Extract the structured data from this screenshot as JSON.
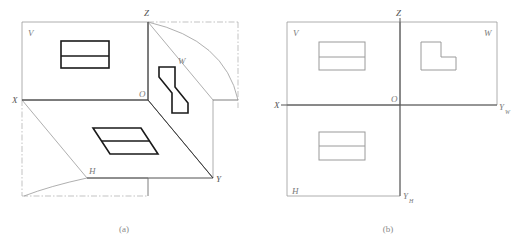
{
  "figure": {
    "background_color": "#ffffff",
    "panels": [
      {
        "id": "panel-a",
        "caption": "(a)",
        "description": "Axonometric pictorial of the three mutually perpendicular projection planes V, H and W meeting at origin O, showing the object's three views in place and the rotation arcs that unfold H downward and W rightward.",
        "labels": {
          "plane_v": "V",
          "plane_h": "H",
          "plane_w": "W",
          "origin": "O",
          "axis_x": "X",
          "axis_y": "Y",
          "axis_z": "Z"
        },
        "views": [
          {
            "name": "front-view-on-v",
            "shape": "rectangle-with-horizontal-divider",
            "plane": "V"
          },
          {
            "name": "top-view-on-h",
            "shape": "parallelogram-with-horizontal-divider",
            "plane": "H"
          },
          {
            "name": "side-view-on-w",
            "shape": "skewed-l-shape",
            "plane": "W"
          }
        ],
        "line_styles": {
          "plane_edge": "solid-thin-gray",
          "object_outline": "solid-thick-black",
          "fold_construction": "dash-dot-gray",
          "rotation_arc": "solid-thin-gray"
        }
      },
      {
        "id": "panel-b",
        "caption": "(b)",
        "description": "The same three planes unfolded into one drawing sheet: front view on V at upper left, side view on W at upper right, top view on H at lower left, divided by the X-Yw horizontal axis and the Z-Yh vertical axis crossing at O.",
        "labels": {
          "plane_v": "V",
          "plane_h": "H",
          "plane_w": "W",
          "origin": "O",
          "axis_x": "X",
          "axis_z": "Z",
          "axis_y_w": "Y",
          "axis_y_w_sub": "W",
          "axis_y_h": "Y",
          "axis_y_h_sub": "H"
        },
        "views": [
          {
            "name": "front-view-on-v",
            "shape": "rectangle-with-horizontal-divider",
            "plane": "V"
          },
          {
            "name": "side-view-on-w",
            "shape": "l-shape",
            "plane": "W"
          },
          {
            "name": "top-view-on-h",
            "shape": "rectangle-with-horizontal-divider",
            "plane": "H"
          }
        ],
        "line_styles": {
          "plane_edge": "solid-thin-gray",
          "axis": "solid-thin-dark-gray",
          "object_outline": "solid-thin-gray"
        }
      }
    ],
    "colors": {
      "plane_edge": "#9a9a9a",
      "axis": "#555555",
      "object_heavy": "#1a1a1a",
      "object_light": "#9a9a9a",
      "construction": "#aaaaaa",
      "label_text": "#7a7a7a",
      "caption_text": "#8a8a8a"
    }
  }
}
